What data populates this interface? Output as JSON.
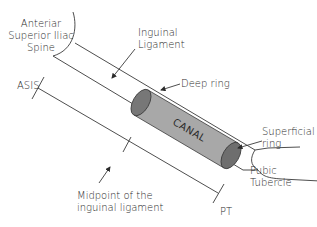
{
  "diagram": {
    "labels": {
      "asis_full": [
        "Anteriar",
        "Superior Iliac",
        "Spine"
      ],
      "inguinal_ligament": [
        "Inguinal",
        "Ligament"
      ],
      "deep_ring": "Deep ring",
      "canal": "CANAL",
      "superficial_ring": [
        "Superficial",
        "ring"
      ],
      "pubic_tubercle": [
        "Pubic",
        "Tubercle"
      ],
      "asis": "ASIS",
      "midpoint": [
        "Midpoint of the",
        "inguinal ligament"
      ],
      "pt": "PT"
    },
    "colors": {
      "line": "#3a3a3a",
      "canal_body": "#a8a8a8",
      "canal_end": "#6e6e6e",
      "text": "#2b2b2b",
      "background": "#ffffff"
    }
  }
}
